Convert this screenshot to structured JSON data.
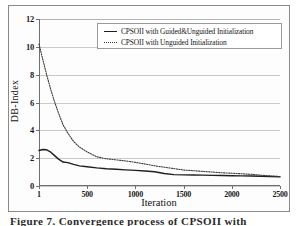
{
  "figure": {
    "caption": "Figure 7. Convergence process of CPSOII with"
  },
  "chart_data": {
    "type": "line",
    "title": "",
    "xlabel": "Iteration",
    "ylabel": "DB-Index",
    "xlim": [
      1,
      2500
    ],
    "ylim": [
      0,
      12
    ],
    "grid": true,
    "legend_position": "top-center",
    "x_ticks": [
      "1",
      "500",
      "1000",
      "1500",
      "2000",
      "2500"
    ],
    "x_tick_values": [
      1,
      500,
      1000,
      1500,
      2000,
      2500
    ],
    "y_ticks": [
      "0",
      "2",
      "4",
      "6",
      "8",
      "10",
      "12"
    ],
    "y_tick_values": [
      0,
      2,
      4,
      6,
      8,
      10,
      12
    ],
    "series": [
      {
        "name": "CPSOII with Guided&Unguided Initialization",
        "style": "solid",
        "color": "#1f1f1f",
        "x": [
          1,
          40,
          80,
          120,
          160,
          200,
          250,
          300,
          360,
          420,
          500,
          600,
          700,
          800,
          900,
          1000,
          1100,
          1200,
          1300,
          1400,
          1500,
          1600,
          1700,
          1800,
          1900,
          2000,
          2100,
          2200,
          2300,
          2400,
          2500
        ],
        "values": [
          2.55,
          2.62,
          2.6,
          2.45,
          2.2,
          1.95,
          1.72,
          1.68,
          1.55,
          1.45,
          1.38,
          1.3,
          1.24,
          1.2,
          1.16,
          1.12,
          1.08,
          1.02,
          0.9,
          0.82,
          0.8,
          0.79,
          0.78,
          0.76,
          0.75,
          0.74,
          0.73,
          0.72,
          0.7,
          0.68,
          0.66
        ]
      },
      {
        "name": "CPSOII with Unguided Initialization",
        "style": "dotted",
        "color": "#3a3a3a",
        "x": [
          1,
          40,
          80,
          120,
          160,
          200,
          250,
          300,
          360,
          420,
          500,
          600,
          700,
          800,
          900,
          1000,
          1100,
          1200,
          1300,
          1400,
          1500,
          1600,
          1700,
          1800,
          1900,
          2000,
          2100,
          2200,
          2300,
          2400,
          2500
        ],
        "values": [
          10.2,
          9.1,
          8.0,
          7.0,
          6.1,
          5.3,
          4.4,
          3.8,
          3.2,
          2.8,
          2.45,
          2.1,
          1.95,
          1.88,
          1.8,
          1.7,
          1.58,
          1.45,
          1.35,
          1.25,
          1.15,
          1.1,
          1.05,
          1.0,
          0.95,
          0.92,
          0.88,
          0.84,
          0.78,
          0.72,
          0.68
        ]
      }
    ],
    "legend": [
      "CPSOII with Guided&Unguided Initialization",
      "CPSOII with Unguided Initialization"
    ]
  }
}
